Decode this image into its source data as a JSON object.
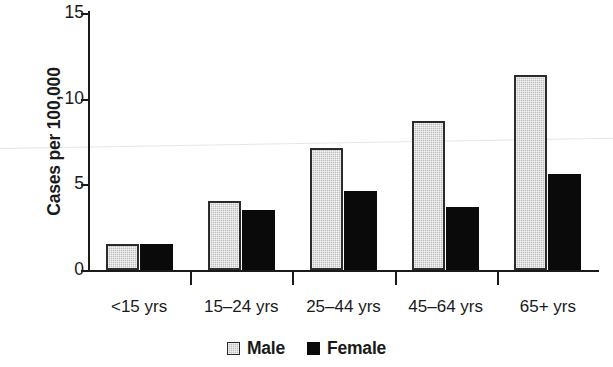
{
  "chart_data": {
    "type": "bar",
    "title": "",
    "xlabel": "",
    "ylabel": "Cases per 100,000",
    "categories": [
      "<15 yrs",
      "15–24 yrs",
      "25–44 yrs",
      "45–64 yrs",
      "65+ yrs"
    ],
    "series": [
      {
        "name": "Male",
        "color": "#bdbdbd",
        "values": [
          1.5,
          4.0,
          7.1,
          8.7,
          11.4
        ]
      },
      {
        "name": "Female",
        "color": "#0a0a0a",
        "values": [
          1.5,
          3.5,
          4.6,
          3.7,
          5.6
        ]
      }
    ],
    "ylim": [
      0,
      15
    ],
    "yticks": [
      "0",
      "5",
      "10",
      "15"
    ],
    "ytick_values": [
      0,
      5,
      10,
      15
    ],
    "grid": false,
    "legend_position": "bottom-center"
  },
  "legend": {
    "items": [
      {
        "label": "Male"
      },
      {
        "label": "Female"
      }
    ]
  }
}
